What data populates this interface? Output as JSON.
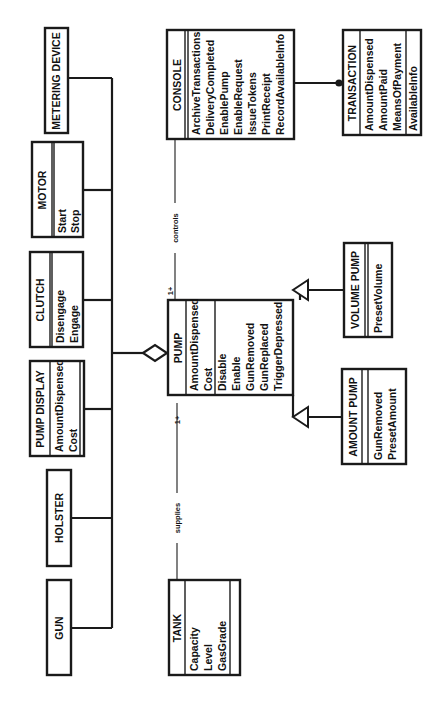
{
  "diagram": {
    "type": "uml-class-diagram",
    "orientation": "rotated-90-ccw",
    "classes": {
      "metering_device": {
        "name": "METERING DEVICE",
        "attributes": [],
        "operations": []
      },
      "motor": {
        "name": "MOTOR",
        "attributes": [],
        "operations": [
          "Start",
          "Stop"
        ]
      },
      "clutch": {
        "name": "CLUTCH",
        "attributes": [],
        "operations": [
          "Disengage",
          "Engage"
        ]
      },
      "pump_display": {
        "name": "PUMP DISPLAY",
        "attributes": [
          "AmountDispensed",
          "Cost"
        ],
        "operations": []
      },
      "holster": {
        "name": "HOLSTER",
        "attributes": [],
        "operations": []
      },
      "gun": {
        "name": "GUN",
        "attributes": [],
        "operations": []
      },
      "pump": {
        "name": "PUMP",
        "attributes": [
          "AmountDispensed",
          "Cost"
        ],
        "operations": [
          "Disable",
          "Enable",
          "GunRemoved",
          "GunReplaced",
          "TriggerDepressed"
        ]
      },
      "console": {
        "name": "CONSOLE",
        "attributes": [],
        "operations": [
          "ArchiveTransactions",
          "DeliveryCompleted",
          "EnablePump",
          "EnableRequest",
          "IssueTokens",
          "PrintReceipt",
          "RecordAvailableInfo"
        ]
      },
      "transaction": {
        "name": "TRANSACTION",
        "attributes": [
          "AmountDispensed",
          "AmountPaid",
          "MeansOfPayment"
        ],
        "operations": [
          "AvailableInfo"
        ]
      },
      "volume_pump": {
        "name": "VOLUME PUMP",
        "attributes": [],
        "operations": [
          "PresetVolume"
        ]
      },
      "amount_pump": {
        "name": "AMOUNT PUMP",
        "attributes": [],
        "operations": [
          "GunRemoved",
          "PresetAmount"
        ]
      },
      "tank": {
        "name": "TANK",
        "attributes": [
          "Capacity",
          "Level",
          "GasGrade"
        ],
        "operations": []
      }
    },
    "relationships": {
      "controls": {
        "label": "controls",
        "from": "CONSOLE",
        "to": "PUMP",
        "multiplicity": "1+"
      },
      "supplies": {
        "label": "supplies",
        "from": "TANK",
        "to": "PUMP",
        "multiplicity": "1+"
      },
      "aggregation": {
        "whole": "PUMP",
        "parts": [
          "METERING DEVICE",
          "MOTOR",
          "CLUTCH",
          "PUMP DISPLAY",
          "HOLSTER",
          "GUN"
        ]
      },
      "console_transaction": {
        "from": "CONSOLE",
        "to": "TRANSACTION",
        "kind": "one-to-many"
      },
      "generalization": {
        "parent": "PUMP",
        "children": [
          "VOLUME PUMP",
          "AMOUNT PUMP"
        ]
      }
    }
  }
}
